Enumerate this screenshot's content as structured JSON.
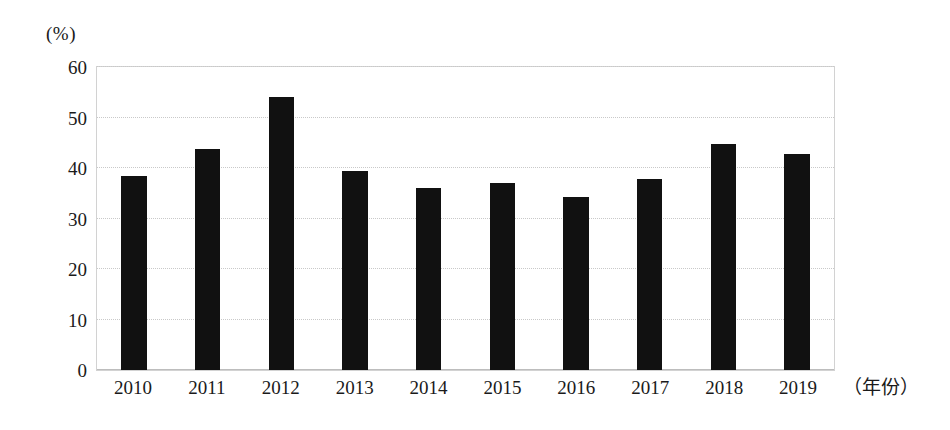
{
  "chart_data": {
    "type": "bar",
    "title": "",
    "subtitle": "",
    "xlabel": "（年份）",
    "ylabel": "(%)",
    "categories": [
      "2010",
      "2011",
      "2012",
      "2013",
      "2014",
      "2015",
      "2016",
      "2017",
      "2018",
      "2019"
    ],
    "values": [
      38.5,
      43.7,
      54.0,
      39.5,
      36.0,
      37.0,
      34.3,
      37.8,
      44.8,
      42.8
    ],
    "ylim": [
      0,
      60
    ],
    "y_ticks": [
      0,
      10,
      20,
      30,
      40,
      50,
      60
    ],
    "y_tick_labels": [
      "0",
      "10",
      "20",
      "30",
      "40",
      "50",
      "60"
    ],
    "grid": true,
    "grid_axis": "y",
    "legend": false,
    "legend_position": "none",
    "bar_color": "#111111",
    "grid_color": "#c9c9c9",
    "frame_color": "#d2d2d2",
    "background_color": "#ffffff"
  }
}
